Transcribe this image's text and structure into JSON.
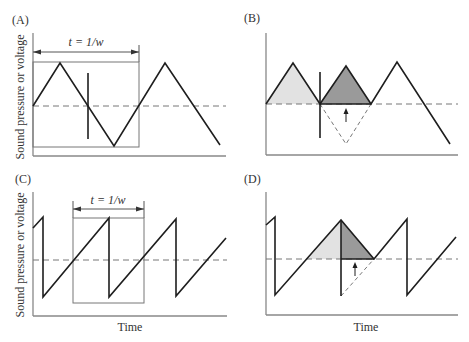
{
  "figure": {
    "panels": [
      {
        "id": "A",
        "label": "(A)",
        "ylabel": "Sound pressure or voltage",
        "period_label": "t = 1/w",
        "waveform": "triangle"
      },
      {
        "id": "B",
        "label": "(B)",
        "waveform": "triangle-rectified"
      },
      {
        "id": "C",
        "label": "(C)",
        "ylabel": "Sound pressure or voltage",
        "xlabel": "Time",
        "period_label": "t = 1/w",
        "waveform": "sawtooth"
      },
      {
        "id": "D",
        "label": "(D)",
        "xlabel": "Time",
        "waveform": "sawtooth-rectified"
      }
    ],
    "colors": {
      "wave": "#1e1e1e",
      "axis": "#888888",
      "dashed": "#777777",
      "fill_light": "#e2e2e2",
      "fill_dark": "#9a9a9a"
    }
  }
}
